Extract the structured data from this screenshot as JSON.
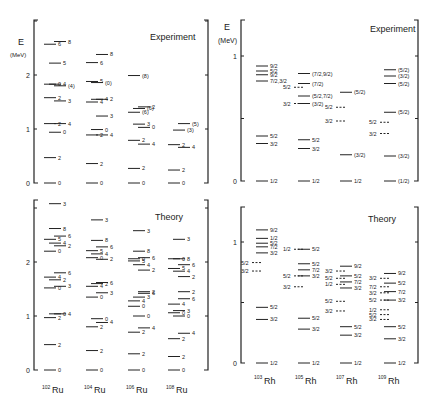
{
  "figure": {
    "ru_panel": {
      "axis_label_E": "E",
      "axis_label_unit": "(MeV)",
      "experiment_title": "Experiment",
      "theory_title": "Theory",
      "y_ticks": [
        "0",
        "1",
        "2"
      ],
      "nuclei": [
        "102Ru",
        "104Ru",
        "106Ru",
        "108Ru"
      ],
      "nuclei_mass": [
        "102",
        "104",
        "106",
        "108"
      ],
      "nuclei_symbol": [
        "Ru",
        "Ru",
        "Ru",
        "Ru"
      ]
    },
    "rh_panel": {
      "axis_label_E": "E",
      "axis_label_unit": "(MeV)",
      "experiment_title": "Experiment",
      "theory_title": "Theory",
      "y_ticks": [
        "0",
        "1"
      ],
      "nuclei": [
        "103Rh",
        "105Rh",
        "107Rh",
        "109Rh"
      ],
      "nuclei_mass": [
        "103",
        "105",
        "107",
        "109"
      ],
      "nuclei_symbol": [
        "Rh",
        "Rh",
        "Rh",
        "Rh"
      ]
    }
  },
  "chart_data": [
    {
      "type": "level_scheme",
      "title": "Ru isotopes - Experiment",
      "ylabel": "E (MeV)",
      "ylim": [
        0,
        3.0
      ],
      "columns": [
        {
          "nucleus": "102Ru",
          "levels": [
            {
              "E": 0.0,
              "J": "0"
            },
            {
              "E": 0.47,
              "J": "2"
            },
            {
              "E": 1.1,
              "J": "4"
            },
            {
              "E": 1.1,
              "J": "2"
            },
            {
              "E": 0.94,
              "J": "0"
            },
            {
              "E": 1.52,
              "J": "3"
            },
            {
              "E": 1.58,
              "J": "2"
            },
            {
              "E": 1.83,
              "J": "4"
            },
            {
              "E": 1.8,
              "J": "(4)"
            },
            {
              "E": 1.83,
              "J": "0"
            },
            {
              "E": 2.22,
              "J": "5"
            },
            {
              "E": 2.62,
              "J": "8"
            },
            {
              "E": 2.57,
              "J": "6"
            }
          ]
        },
        {
          "nucleus": "104Ru",
          "levels": [
            {
              "E": 0.0,
              "J": "0"
            },
            {
              "E": 0.36,
              "J": "2"
            },
            {
              "E": 0.89,
              "J": "4"
            },
            {
              "E": 0.89,
              "J": "2"
            },
            {
              "E": 0.99,
              "J": "0"
            },
            {
              "E": 1.24,
              "J": "3"
            },
            {
              "E": 1.5,
              "J": "4"
            },
            {
              "E": 1.55,
              "J": "4"
            },
            {
              "E": 1.55,
              "J": "2"
            },
            {
              "E": 1.88,
              "J": "5"
            },
            {
              "E": 1.86,
              "J": "(0)"
            },
            {
              "E": 2.38,
              "J": "8"
            },
            {
              "E": 2.23,
              "J": "6"
            }
          ]
        },
        {
          "nucleus": "106Ru",
          "levels": [
            {
              "E": 0.0,
              "J": "0"
            },
            {
              "E": 0.27,
              "J": "2"
            },
            {
              "E": 0.72,
              "J": "4"
            },
            {
              "E": 0.79,
              "J": "2"
            },
            {
              "E": 1.09,
              "J": "3"
            },
            {
              "E": 1.03,
              "J": "0"
            },
            {
              "E": 1.31,
              "J": "(6)"
            },
            {
              "E": 1.38,
              "J": "(6)"
            },
            {
              "E": 1.41,
              "J": "2"
            },
            {
              "E": 1.99,
              "J": "(8)"
            }
          ]
        },
        {
          "nucleus": "108Ru",
          "levels": [
            {
              "E": 0.0,
              "J": "0"
            },
            {
              "E": 0.24,
              "J": "2"
            },
            {
              "E": 0.66,
              "J": "4"
            },
            {
              "E": 0.71,
              "J": "2"
            },
            {
              "E": 0.98,
              "J": "(3)"
            },
            {
              "E": 1.1,
              "J": "(5)"
            }
          ]
        }
      ]
    },
    {
      "type": "level_scheme",
      "title": "Ru isotopes - Theory",
      "ylabel": "E (MeV)",
      "ylim": [
        0,
        3.1
      ],
      "columns": [
        {
          "nucleus": "102Ru",
          "levels": [
            {
              "E": 0.0,
              "J": "0"
            },
            {
              "E": 0.47,
              "J": "2"
            },
            {
              "E": 1.04,
              "J": "4"
            },
            {
              "E": 0.97,
              "J": "2"
            },
            {
              "E": 1.04,
              "J": "0"
            },
            {
              "E": 1.8,
              "J": "6"
            },
            {
              "E": 1.72,
              "J": "4"
            },
            {
              "E": 1.67,
              "J": "2"
            },
            {
              "E": 1.55,
              "J": "3"
            },
            {
              "E": 1.52,
              "J": "0"
            },
            {
              "E": 2.62,
              "J": "8"
            },
            {
              "E": 2.48,
              "J": "6"
            },
            {
              "E": 2.42,
              "J": "5"
            },
            {
              "E": 2.35,
              "J": "4"
            },
            {
              "E": 2.3,
              "J": "2"
            },
            {
              "E": 2.2,
              "J": "0"
            },
            {
              "E": 3.08,
              "J": "3"
            }
          ]
        },
        {
          "nucleus": "104Ru",
          "levels": [
            {
              "E": 0.0,
              "J": "0"
            },
            {
              "E": 0.36,
              "J": "2"
            },
            {
              "E": 0.88,
              "J": "4"
            },
            {
              "E": 0.8,
              "J": "2"
            },
            {
              "E": 0.95,
              "J": "0"
            },
            {
              "E": 1.62,
              "J": "6"
            },
            {
              "E": 1.55,
              "J": "4"
            },
            {
              "E": 1.6,
              "J": "2"
            },
            {
              "E": 1.43,
              "J": "3"
            },
            {
              "E": 1.35,
              "J": "0"
            },
            {
              "E": 2.4,
              "J": "8"
            },
            {
              "E": 2.28,
              "J": "6"
            },
            {
              "E": 2.21,
              "J": "5"
            },
            {
              "E": 2.15,
              "J": "4"
            },
            {
              "E": 2.05,
              "J": "2"
            },
            {
              "E": 2.08,
              "J": "0"
            },
            {
              "E": 2.78,
              "J": "3"
            }
          ]
        },
        {
          "nucleus": "106Ru",
          "levels": [
            {
              "E": 0.0,
              "J": "0"
            },
            {
              "E": 0.3,
              "J": "2"
            },
            {
              "E": 0.78,
              "J": "4"
            },
            {
              "E": 0.7,
              "J": "2"
            },
            {
              "E": 1.0,
              "J": "0"
            },
            {
              "E": 1.42,
              "J": "6"
            },
            {
              "E": 1.28,
              "J": "4"
            },
            {
              "E": 1.35,
              "J": "3"
            },
            {
              "E": 1.45,
              "J": "2"
            },
            {
              "E": 1.18,
              "J": "0"
            },
            {
              "E": 2.2,
              "J": "8"
            },
            {
              "E": 2.08,
              "J": "6"
            },
            {
              "E": 2.02,
              "J": "5"
            },
            {
              "E": 1.95,
              "J": "4"
            },
            {
              "E": 1.85,
              "J": "2"
            },
            {
              "E": 2.06,
              "J": "0"
            },
            {
              "E": 2.58,
              "J": "3"
            }
          ]
        },
        {
          "nucleus": "108Ru",
          "levels": [
            {
              "E": 0.0,
              "J": "0"
            },
            {
              "E": 0.25,
              "J": "2"
            },
            {
              "E": 0.68,
              "J": "4"
            },
            {
              "E": 0.58,
              "J": "2"
            },
            {
              "E": 1.0,
              "J": "0"
            },
            {
              "E": 1.32,
              "J": "6"
            },
            {
              "E": 1.22,
              "J": "4"
            },
            {
              "E": 1.1,
              "J": "3"
            },
            {
              "E": 1.45,
              "J": "2"
            },
            {
              "E": 1.06,
              "J": "0"
            },
            {
              "E": 2.06,
              "J": "8"
            },
            {
              "E": 1.95,
              "J": "6"
            },
            {
              "E": 1.88,
              "J": "5"
            },
            {
              "E": 1.83,
              "J": "4"
            },
            {
              "E": 1.73,
              "J": "2"
            },
            {
              "E": 2.06,
              "J": "0"
            },
            {
              "E": 2.42,
              "J": "3"
            }
          ]
        }
      ]
    },
    {
      "type": "level_scheme",
      "title": "Rh isotopes - Experiment",
      "ylabel": "E (MeV)",
      "ylim": [
        0,
        1.29
      ],
      "columns": [
        {
          "nucleus": "103Rh",
          "levels": [
            {
              "E": 0.0,
              "J": "1/2",
              "style": "solid"
            },
            {
              "E": 0.3,
              "J": "3/2",
              "style": "solid"
            },
            {
              "E": 0.36,
              "J": "5/2",
              "style": "solid"
            },
            {
              "E": 0.8,
              "J": "7/2,3/2",
              "style": "solid"
            },
            {
              "E": 0.85,
              "J": "9/2",
              "style": "solid"
            },
            {
              "E": 0.88,
              "J": "5/2",
              "style": "solid"
            },
            {
              "E": 0.92,
              "J": "9/2",
              "style": "solid"
            }
          ]
        },
        {
          "nucleus": "105Rh",
          "levels": [
            {
              "E": 0.0,
              "J": "1/2",
              "style": "solid"
            },
            {
              "E": 0.26,
              "J": "3/2",
              "style": "solid"
            },
            {
              "E": 0.33,
              "J": "5/2",
              "style": "solid"
            },
            {
              "E": 0.62,
              "J": "3/2",
              "style": "dashed"
            },
            {
              "E": 0.62,
              "J": "(3/2)",
              "style": "solid"
            },
            {
              "E": 0.68,
              "J": "(5/2,7/2)",
              "style": "solid"
            },
            {
              "E": 0.75,
              "J": "5/2",
              "style": "dashed"
            },
            {
              "E": 0.78,
              "J": "(7/2)",
              "style": "solid"
            },
            {
              "E": 0.86,
              "J": "(7/2,9/2)",
              "style": "solid"
            }
          ]
        },
        {
          "nucleus": "107Rh",
          "levels": [
            {
              "E": 0.0,
              "J": "1/2",
              "style": "solid"
            },
            {
              "E": 0.21,
              "J": "(3/2)",
              "style": "solid"
            },
            {
              "E": 0.48,
              "J": "3/2",
              "style": "dashed"
            },
            {
              "E": 0.59,
              "J": "5/2",
              "style": "dashed"
            },
            {
              "E": 0.71,
              "J": "(5/2)",
              "style": "solid"
            }
          ]
        },
        {
          "nucleus": "109Rh",
          "levels": [
            {
              "E": 0.0,
              "J": "(1/2)",
              "style": "solid"
            },
            {
              "E": 0.2,
              "J": "(3/2)",
              "style": "solid"
            },
            {
              "E": 0.38,
              "J": "3/2",
              "style": "dashed"
            },
            {
              "E": 0.47,
              "J": "5/2",
              "style": "dashed"
            },
            {
              "E": 0.55,
              "J": "(5/2)",
              "style": "solid"
            },
            {
              "E": 0.78,
              "J": "(5/2)",
              "style": "solid"
            },
            {
              "E": 0.84,
              "J": "(3/2)",
              "style": "solid"
            },
            {
              "E": 0.89,
              "J": "(5/2)",
              "style": "solid"
            }
          ]
        }
      ]
    },
    {
      "type": "level_scheme",
      "title": "Rh isotopes - Theory",
      "ylabel": "E (MeV)",
      "ylim": [
        0,
        1.29
      ],
      "columns": [
        {
          "nucleus": "103Rh",
          "levels": [
            {
              "E": 0.0,
              "J": "1/2",
              "style": "solid"
            },
            {
              "E": 0.36,
              "J": "3/2",
              "style": "solid"
            },
            {
              "E": 0.46,
              "J": "5/2",
              "style": "solid"
            },
            {
              "E": 0.76,
              "J": "3/2",
              "style": "dashed"
            },
            {
              "E": 0.83,
              "J": "5/2",
              "style": "dashed"
            },
            {
              "E": 0.91,
              "J": "3/2",
              "style": "solid"
            },
            {
              "E": 0.96,
              "J": "7/2",
              "style": "solid"
            },
            {
              "E": 0.99,
              "J": "5/2",
              "style": "solid"
            },
            {
              "E": 1.03,
              "J": "1/2",
              "style": "solid"
            },
            {
              "E": 1.1,
              "J": "9/2",
              "style": "solid"
            }
          ]
        },
        {
          "nucleus": "105Rh",
          "levels": [
            {
              "E": 0.0,
              "J": "1/2",
              "style": "solid"
            },
            {
              "E": 0.28,
              "J": "3/2",
              "style": "solid"
            },
            {
              "E": 0.37,
              "J": "5/2",
              "style": "solid"
            },
            {
              "E": 0.63,
              "J": "3/2",
              "style": "dashed"
            },
            {
              "E": 0.72,
              "J": "5/2",
              "style": "dashed"
            },
            {
              "E": 0.72,
              "J": "3/2",
              "style": "solid"
            },
            {
              "E": 0.77,
              "J": "7/2",
              "style": "solid"
            },
            {
              "E": 0.82,
              "J": "5/2",
              "style": "solid"
            },
            {
              "E": 0.94,
              "J": "1/2",
              "style": "dashed"
            },
            {
              "E": 0.94,
              "J": "5/2",
              "style": "solid"
            }
          ]
        },
        {
          "nucleus": "107Rh",
          "levels": [
            {
              "E": 0.0,
              "J": "1/2",
              "style": "solid"
            },
            {
              "E": 0.23,
              "J": "3/2",
              "style": "solid"
            },
            {
              "E": 0.3,
              "J": "5/2",
              "style": "solid"
            },
            {
              "E": 0.43,
              "J": "3/2",
              "style": "dashed"
            },
            {
              "E": 0.51,
              "J": "5/2",
              "style": "dashed"
            },
            {
              "E": 0.62,
              "J": "3/2",
              "style": "solid"
            },
            {
              "E": 0.65,
              "J": "1/2",
              "style": "dashed"
            },
            {
              "E": 0.67,
              "J": "7/2",
              "style": "solid"
            },
            {
              "E": 0.7,
              "J": "5/2",
              "style": "dashed"
            },
            {
              "E": 0.72,
              "J": "5/2",
              "style": "solid"
            },
            {
              "E": 0.76,
              "J": "3/2",
              "style": "dashed"
            },
            {
              "E": 0.8,
              "J": "9/2",
              "style": "solid"
            }
          ]
        },
        {
          "nucleus": "109Rh",
          "levels": [
            {
              "E": 0.0,
              "J": "1/2",
              "style": "solid"
            },
            {
              "E": 0.2,
              "J": "3/2",
              "style": "solid"
            },
            {
              "E": 0.3,
              "J": "5/2",
              "style": "solid"
            },
            {
              "E": 0.36,
              "J": "3/2",
              "style": "dashed"
            },
            {
              "E": 0.4,
              "J": "5/2",
              "style": "dashed"
            },
            {
              "E": 0.44,
              "J": "1/2",
              "style": "dashed"
            },
            {
              "E": 0.52,
              "J": "5/2",
              "style": "dashed"
            },
            {
              "E": 0.52,
              "J": "3/2",
              "style": "solid"
            },
            {
              "E": 0.58,
              "J": "3/2",
              "style": "dashed"
            },
            {
              "E": 0.59,
              "J": "7/2",
              "style": "solid"
            },
            {
              "E": 0.63,
              "J": "7/2",
              "style": "dashed"
            },
            {
              "E": 0.66,
              "J": "5/2",
              "style": "solid"
            },
            {
              "E": 0.7,
              "J": "3/2",
              "style": "dashed"
            },
            {
              "E": 0.74,
              "J": "9/2",
              "style": "solid"
            }
          ]
        }
      ]
    }
  ]
}
